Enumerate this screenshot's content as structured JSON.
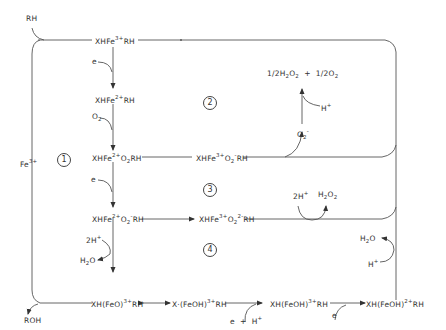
{
  "diagram": {
    "colors": {
      "line": "#555555",
      "text": "#333333",
      "background": "#ffffff"
    },
    "substrate_in": "RH",
    "product_out": "ROH",
    "iron_label": "Fe",
    "iron_charge": "3+",
    "species": [
      {
        "id": "s1",
        "pre": "XHFe",
        "sup": "3+",
        "post": "RH"
      },
      {
        "id": "s2",
        "pre": "XHFe",
        "sup": "2+",
        "post": "RH"
      },
      {
        "id": "s3",
        "pre": "XHFe",
        "sup": "2+",
        "mid": "O",
        "sub": "2",
        "post": "RH"
      },
      {
        "id": "s4",
        "pre": "XHFe",
        "sup": "3+",
        "mid": "O",
        "sub": "2",
        "sup2": "-",
        "post": "RH"
      },
      {
        "id": "s5",
        "pre": "XHFe",
        "sup": "2+",
        "mid": "O",
        "sub": "2",
        "sup2": "-",
        "post": "RH"
      },
      {
        "id": "s6",
        "pre": "XHFe",
        "sup": "3+",
        "mid": "O",
        "sub": "2",
        "sup2": "2-",
        "post": "RH"
      },
      {
        "id": "s7",
        "pre": "XH(FeO)",
        "sup": "3+",
        "post": "RH"
      },
      {
        "id": "s8",
        "pre": "X·(FeOH)",
        "sup": "3+",
        "post": "RH"
      },
      {
        "id": "s9",
        "pre": "XH(FeOH)",
        "sup": "3+",
        "post": "RH"
      },
      {
        "id": "s10",
        "pre": "XH(FeOH)",
        "sup": "2+",
        "post": "RH"
      }
    ],
    "reagents": {
      "e1": "e",
      "o2_in": "O",
      "o2_sub": "2",
      "e2": "e",
      "two_h_plus_1": "2H",
      "two_h_plus_1_sup": "+",
      "h2o_1": "H",
      "h2o_1_sub": "2",
      "h2o_1_post": "O",
      "superoxide": "O",
      "superoxide_sub": "2",
      "superoxide_sup": "-",
      "h_plus_2": "H",
      "h_plus_2_sup": "+",
      "disprop_a": "1/2H",
      "disprop_a_sub1": "2",
      "disprop_a_mid": "O",
      "disprop_a_sub2": "2",
      "disprop_plus": "+",
      "disprop_b": "1/2O",
      "disprop_b_sub": "2",
      "two_h_plus_3": "2H",
      "two_h_plus_3_sup": "+",
      "h2o2": "H",
      "h2o2_sub1": "2",
      "h2o2_mid": "O",
      "h2o2_sub2": "2",
      "h2o_2": "H",
      "h2o_2_sub": "2",
      "h2o_2_post": "O",
      "h_plus_4": "H",
      "h_plus_4_sup": "+",
      "e_plus_h": "e  +  H",
      "e_plus_h_sup": "+",
      "e3": "e"
    },
    "pathways": [
      "1",
      "2",
      "3",
      "4"
    ]
  }
}
